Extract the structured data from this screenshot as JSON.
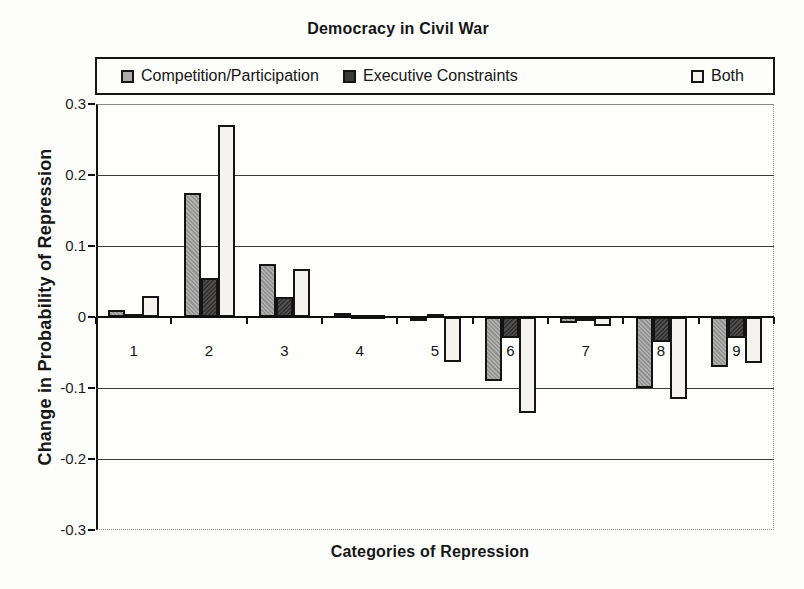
{
  "title": "Democracy in Civil War",
  "y_axis": {
    "label": "Change in Probability of Repression",
    "ticks": [
      {
        "label": "0.3",
        "value": 0.3
      },
      {
        "label": "0.2",
        "value": 0.2
      },
      {
        "label": "0.1",
        "value": 0.1
      },
      {
        "label": "0",
        "value": 0.0
      },
      {
        "label": "-0.1",
        "value": -0.1
      },
      {
        "label": "-0.2",
        "value": -0.2
      },
      {
        "label": "-0.3",
        "value": -0.3
      }
    ]
  },
  "x_axis": {
    "label": "Categories of Repression",
    "categories": [
      "1",
      "2",
      "3",
      "4",
      "5",
      "6",
      "7",
      "8",
      "9"
    ]
  },
  "chart_data": {
    "type": "bar",
    "title": "Democracy in Civil War",
    "xlabel": "Categories of Repression",
    "ylabel": "Change in Probability of Repression",
    "categories": [
      1,
      2,
      3,
      4,
      5,
      6,
      7,
      8,
      9
    ],
    "series": [
      {
        "name": "Competition/Participation",
        "color": "#ababab",
        "values": [
          0.01,
          0.175,
          0.075,
          0.005,
          -0.002,
          -0.09,
          -0.008,
          -0.1,
          -0.07
        ]
      },
      {
        "name": "Executive Constraints",
        "color": "#3a3a3a",
        "values": [
          0.004,
          0.055,
          0.028,
          0.002,
          0.004,
          -0.03,
          -0.002,
          -0.035,
          -0.03
        ]
      },
      {
        "name": "Both",
        "color": "#f4f3ee",
        "values": [
          0.03,
          0.27,
          0.067,
          0.001,
          -0.063,
          -0.135,
          -0.012,
          -0.115,
          -0.065
        ]
      }
    ],
    "ylim": [
      -0.3,
      0.3
    ],
    "ytick_step": 0.1,
    "grid": true,
    "legend_position": "top"
  }
}
